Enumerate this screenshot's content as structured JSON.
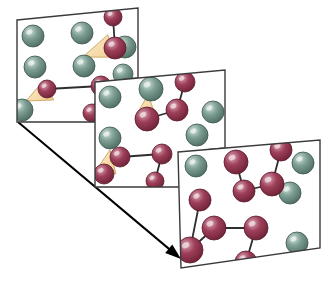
{
  "figure": {
    "background_color": "#ffffff",
    "panel_fill": "#ffffff",
    "panel_stroke": "#3a3a3a",
    "panel_stroke_width": 1.4
  },
  "palette": {
    "green_sphere_core": "#7d9e93",
    "green_sphere_light": "#cfe0d8",
    "green_sphere_dark": "#4e6d63",
    "green_sphere_edge": "#3d554d",
    "red_sphere_core": "#9e3f5a",
    "red_sphere_light": "#d9a5b4",
    "red_sphere_dark": "#6e2236",
    "red_sphere_edge": "#5a1a2b",
    "cone_fill": "#f4d39a",
    "cone_light": "#fbeccb",
    "cone_edge": "#c9a05a",
    "bond_color": "#2e2e2e",
    "arrow_color": "#000000"
  },
  "legend_semantics": {
    "green_sphere_label": "matrix atom",
    "red_sphere_label": "reactive monomer atom",
    "cone_label": "reaction direction cone",
    "bond_label": "covalent bond",
    "arrow_label": "time progression arrow"
  },
  "time_arrow": {
    "name": "time-progression-arrow",
    "start_x": 18,
    "start_y": 122,
    "end_x": 181,
    "end_y": 259,
    "stroke_width": 2.0,
    "head_length": 16,
    "head_width": 11
  },
  "panels": [
    {
      "id": "panel-1",
      "stage": 1,
      "outline": [
        [
          17,
          20
        ],
        [
          138,
          8
        ],
        [
          138,
          78
        ],
        [
          120,
          80
        ],
        [
          120,
          122
        ],
        [
          17,
          122
        ]
      ],
      "clip": [
        [
          17,
          20
        ],
        [
          138,
          8
        ],
        [
          138,
          78
        ],
        [
          120,
          80
        ],
        [
          120,
          122
        ],
        [
          17,
          122
        ]
      ],
      "spheres": [
        {
          "type": "green",
          "cx": 33,
          "cy": 36,
          "r": 11
        },
        {
          "type": "green",
          "cx": 82,
          "cy": 33,
          "r": 11
        },
        {
          "type": "green",
          "cx": 125,
          "cy": 47,
          "r": 11
        },
        {
          "type": "green",
          "cx": 35,
          "cy": 67,
          "r": 11
        },
        {
          "type": "green",
          "cx": 84,
          "cy": 66,
          "r": 11
        },
        {
          "type": "green",
          "cx": 123,
          "cy": 74,
          "r": 10
        },
        {
          "type": "green",
          "cx": 22,
          "cy": 110,
          "r": 11
        },
        {
          "type": "red",
          "cx": 113,
          "cy": 17,
          "r": 9
        },
        {
          "type": "red",
          "cx": 115,
          "cy": 48,
          "r": 11
        },
        {
          "type": "red",
          "cx": 47,
          "cy": 89,
          "r": 9
        },
        {
          "type": "red",
          "cx": 101,
          "cy": 86,
          "r": 10
        },
        {
          "type": "red",
          "cx": 92,
          "cy": 113,
          "r": 9
        }
      ],
      "bonds": [
        {
          "x1": 113,
          "y1": 17,
          "x2": 115,
          "y2": 48
        },
        {
          "x1": 47,
          "y1": 89,
          "x2": 101,
          "y2": 86
        },
        {
          "x1": 101,
          "y1": 86,
          "x2": 92,
          "y2": 113
        }
      ],
      "cones": [
        {
          "apex_x": 83,
          "apex_y": 57,
          "base_cx": 112,
          "base_cy": 46,
          "base_half": 12
        },
        {
          "apex_x": 26,
          "apex_y": 101,
          "base_cx": 49,
          "base_cy": 90,
          "base_half": 11
        }
      ]
    },
    {
      "id": "panel-2",
      "stage": 2,
      "outline": [
        [
          95,
          82
        ],
        [
          225,
          70
        ],
        [
          225,
          148
        ],
        [
          205,
          150
        ],
        [
          205,
          187
        ],
        [
          95,
          187
        ]
      ],
      "clip": [
        [
          95,
          82
        ],
        [
          225,
          70
        ],
        [
          225,
          148
        ],
        [
          205,
          150
        ],
        [
          205,
          187
        ],
        [
          95,
          187
        ]
      ],
      "spheres": [
        {
          "type": "green",
          "cx": 110,
          "cy": 97,
          "r": 11
        },
        {
          "type": "green",
          "cx": 151,
          "cy": 89,
          "r": 12
        },
        {
          "type": "green",
          "cx": 213,
          "cy": 112,
          "r": 11
        },
        {
          "type": "green",
          "cx": 110,
          "cy": 138,
          "r": 11
        },
        {
          "type": "green",
          "cx": 197,
          "cy": 135,
          "r": 11
        },
        {
          "type": "red",
          "cx": 185,
          "cy": 82,
          "r": 10
        },
        {
          "type": "red",
          "cx": 177,
          "cy": 110,
          "r": 11
        },
        {
          "type": "red",
          "cx": 147,
          "cy": 119,
          "r": 12
        },
        {
          "type": "red",
          "cx": 120,
          "cy": 157,
          "r": 10
        },
        {
          "type": "red",
          "cx": 104,
          "cy": 174,
          "r": 10
        },
        {
          "type": "red",
          "cx": 162,
          "cy": 154,
          "r": 10
        },
        {
          "type": "red",
          "cx": 155,
          "cy": 181,
          "r": 9
        }
      ],
      "bonds": [
        {
          "x1": 185,
          "y1": 82,
          "x2": 177,
          "y2": 110
        },
        {
          "x1": 177,
          "y1": 110,
          "x2": 147,
          "y2": 119
        },
        {
          "x1": 104,
          "y1": 174,
          "x2": 120,
          "y2": 157
        },
        {
          "x1": 120,
          "y1": 157,
          "x2": 162,
          "y2": 154
        },
        {
          "x1": 162,
          "y1": 154,
          "x2": 155,
          "y2": 181
        }
      ],
      "cones": [
        {
          "apex_x": 148,
          "apex_y": 95,
          "base_cx": 146,
          "base_cy": 118,
          "base_half": 11
        },
        {
          "apex_x": 110,
          "apex_y": 150,
          "base_cx": 106,
          "base_cy": 172,
          "base_half": 10
        }
      ]
    },
    {
      "id": "panel-3",
      "stage": 3,
      "outline": [
        [
          178,
          152
        ],
        [
          320,
          140
        ],
        [
          320,
          248
        ],
        [
          181,
          268
        ]
      ],
      "clip": [
        [
          178,
          152
        ],
        [
          320,
          140
        ],
        [
          320,
          248
        ],
        [
          181,
          268
        ]
      ],
      "spheres": [
        {
          "type": "green",
          "cx": 196,
          "cy": 166,
          "r": 11
        },
        {
          "type": "green",
          "cx": 303,
          "cy": 163,
          "r": 11
        },
        {
          "type": "green",
          "cx": 290,
          "cy": 193,
          "r": 11
        },
        {
          "type": "green",
          "cx": 297,
          "cy": 243,
          "r": 11
        },
        {
          "type": "red",
          "cx": 236,
          "cy": 162,
          "r": 12
        },
        {
          "type": "red",
          "cx": 281,
          "cy": 150,
          "r": 11
        },
        {
          "type": "red",
          "cx": 272,
          "cy": 184,
          "r": 12
        },
        {
          "type": "red",
          "cx": 244,
          "cy": 191,
          "r": 11
        },
        {
          "type": "red",
          "cx": 200,
          "cy": 200,
          "r": 11
        },
        {
          "type": "red",
          "cx": 214,
          "cy": 228,
          "r": 12
        },
        {
          "type": "red",
          "cx": 190,
          "cy": 250,
          "r": 13
        },
        {
          "type": "red",
          "cx": 256,
          "cy": 228,
          "r": 12
        },
        {
          "type": "red",
          "cx": 246,
          "cy": 262,
          "r": 11
        }
      ],
      "bonds": [
        {
          "x1": 236,
          "y1": 162,
          "x2": 244,
          "y2": 191
        },
        {
          "x1": 244,
          "y1": 191,
          "x2": 272,
          "y2": 184
        },
        {
          "x1": 272,
          "y1": 184,
          "x2": 281,
          "y2": 150
        },
        {
          "x1": 200,
          "y1": 200,
          "x2": 190,
          "y2": 250
        },
        {
          "x1": 190,
          "y1": 250,
          "x2": 214,
          "y2": 228
        },
        {
          "x1": 214,
          "y1": 228,
          "x2": 256,
          "y2": 228
        },
        {
          "x1": 256,
          "y1": 228,
          "x2": 246,
          "y2": 262
        }
      ],
      "cones": []
    }
  ]
}
